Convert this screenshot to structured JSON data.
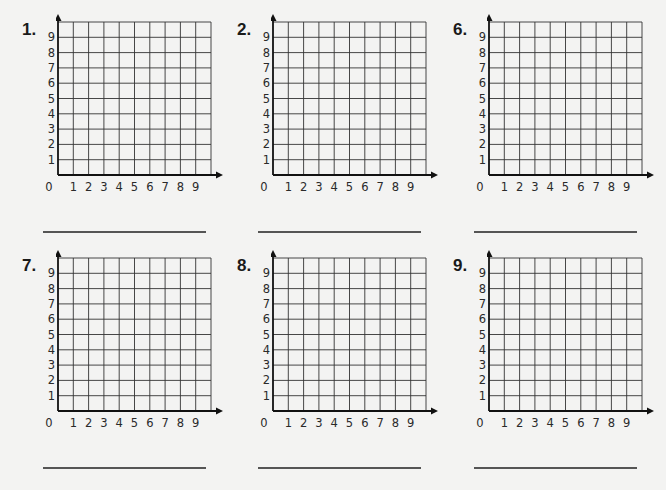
{
  "worksheet": {
    "panels": [
      {
        "number": "1.",
        "x": 0,
        "y": 0,
        "gx": 58,
        "gy": 22
      },
      {
        "number": "2.",
        "x": 215,
        "y": 0,
        "gx": 273,
        "gy": 22
      },
      {
        "number": "6.",
        "x": 431,
        "y": 0,
        "gx": 489,
        "gy": 22
      },
      {
        "number": "7.",
        "x": 0,
        "y": 240,
        "gx": 58,
        "gy": 258
      },
      {
        "number": "8.",
        "x": 215,
        "y": 240,
        "gx": 273,
        "gy": 258
      },
      {
        "number": "9.",
        "x": 431,
        "y": 240,
        "gx": 489,
        "gy": 258
      }
    ],
    "grid": {
      "cells_x": 10,
      "cells_y": 10,
      "cell_size": 15.3,
      "x_labels": [
        "1",
        "2",
        "3",
        "4",
        "5",
        "6",
        "7",
        "8",
        "9"
      ],
      "y_labels": [
        "1",
        "2",
        "3",
        "4",
        "5",
        "6",
        "7",
        "8",
        "9"
      ],
      "origin_label": "0",
      "line_color": "#333333",
      "axis_color": "#111111"
    },
    "answer_line_color": "#555555"
  }
}
